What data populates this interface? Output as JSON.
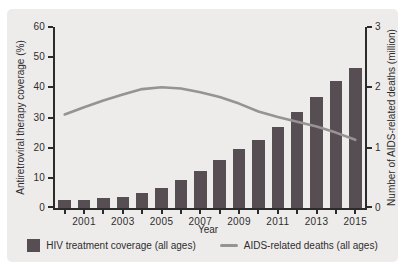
{
  "colors": {
    "panel_bg": "#edeceb",
    "axis": "#2b2b2b",
    "text": "#2f2d2e",
    "bar": "#564e53",
    "line": "#979293"
  },
  "chart_data": {
    "type": "bar+line",
    "categories": [
      2000,
      2001,
      2002,
      2003,
      2004,
      2005,
      2006,
      2007,
      2008,
      2009,
      2010,
      2011,
      2012,
      2013,
      2014,
      2015
    ],
    "series": [
      {
        "name": "HIV treatment coverage (all ages)",
        "type": "bar",
        "axis": "left",
        "color": "#564e53",
        "values": [
          2.5,
          2.8,
          3.2,
          3.8,
          5.0,
          6.7,
          9.2,
          12.3,
          15.8,
          19.7,
          22.5,
          27.0,
          31.7,
          36.7,
          42.0,
          46.4
        ]
      },
      {
        "name": "AIDS-related deaths (all ages)",
        "type": "line",
        "axis": "right",
        "color": "#979293",
        "values": [
          1.55,
          1.67,
          1.78,
          1.88,
          1.97,
          2.0,
          1.98,
          1.92,
          1.84,
          1.73,
          1.6,
          1.51,
          1.43,
          1.35,
          1.25,
          1.13
        ]
      }
    ],
    "xlabel": "Year",
    "ylabel_left": "Antiretroviral therapy coverage (%)",
    "ylabel_right": "Number of AIDS-related deaths (million)",
    "ylim_left": [
      0,
      60
    ],
    "ylim_right": [
      0,
      3
    ],
    "yticks_left": [
      0,
      10,
      20,
      30,
      40,
      50,
      60
    ],
    "yticks_right": [
      0,
      1,
      2,
      3
    ],
    "xtick_labels": [
      "2001",
      "2003",
      "2005",
      "2007",
      "2009",
      "2011",
      "2013",
      "2015"
    ],
    "grid": false,
    "legend_position": "bottom",
    "legend": [
      {
        "label": "HIV treatment coverage (all ages)",
        "swatch": "square"
      },
      {
        "label": "AIDS-related deaths (all ages)",
        "swatch": "line"
      }
    ]
  }
}
